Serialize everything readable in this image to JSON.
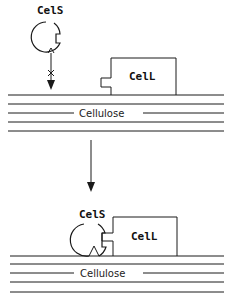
{
  "diagram": {
    "top_panel": {
      "cels_label": "CelS",
      "cell_label": "CelL",
      "cellulose_label": "Cellulose",
      "blocked_marker": "x"
    },
    "bottom_panel": {
      "cels_label": "CelS",
      "cell_label": "CelL",
      "cellulose_label": "Cellulose"
    },
    "colors": {
      "line": "#1a1a1a",
      "background": "#ffffff"
    }
  }
}
